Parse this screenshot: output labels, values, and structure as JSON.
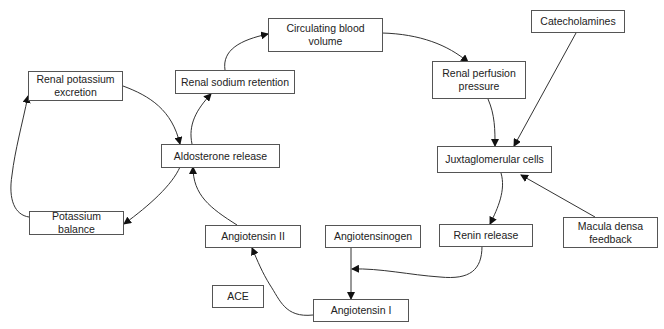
{
  "diagram": {
    "type": "flowchart",
    "nodes": {
      "renal_potassium_excretion": "Renal potassium excretion",
      "renal_sodium_retention": "Renal sodium retention",
      "circulating_blood_volume": "Circulating blood volume",
      "renal_perfusion_pressure": "Renal perfusion pressure",
      "catecholamines": "Catecholamines",
      "aldosterone_release": "Aldosterone release",
      "juxtaglomerular_cells": "Juxtaglomerular cells",
      "potassium_balance": "Potassium balance",
      "angiotensin_ii": "Angiotensin II",
      "angiotensinogen": "Angiotensinogen",
      "renin_release": "Renin release",
      "macula_densa_feedback": "Macula densa feedback",
      "ace": "ACE",
      "angiotensin_i": "Angiotensin I"
    },
    "edges": [
      {
        "from": "Aldosterone release",
        "to": "Renal sodium retention"
      },
      {
        "from": "Renal sodium retention",
        "to": "Circulating blood volume"
      },
      {
        "from": "Circulating blood volume",
        "to": "Renal perfusion pressure"
      },
      {
        "from": "Renal perfusion pressure",
        "to": "Juxtaglomerular cells"
      },
      {
        "from": "Catecholamines",
        "to": "Juxtaglomerular cells"
      },
      {
        "from": "Macula densa feedback",
        "to": "Juxtaglomerular cells"
      },
      {
        "from": "Juxtaglomerular cells",
        "to": "Renin release"
      },
      {
        "from": "Renin release",
        "to": "Angiotensinogen → Angiotensin I"
      },
      {
        "from": "Angiotensinogen",
        "to": "Angiotensin I"
      },
      {
        "from": "Angiotensin I",
        "to": "Angiotensin II"
      },
      {
        "from": "Angiotensin II",
        "to": "Aldosterone release"
      },
      {
        "from": "Aldosterone release",
        "to": "Potassium balance"
      },
      {
        "from": "Potassium balance",
        "to": "Renal potassium excretion"
      },
      {
        "from": "Renal potassium excretion",
        "to": "Aldosterone release"
      }
    ]
  }
}
